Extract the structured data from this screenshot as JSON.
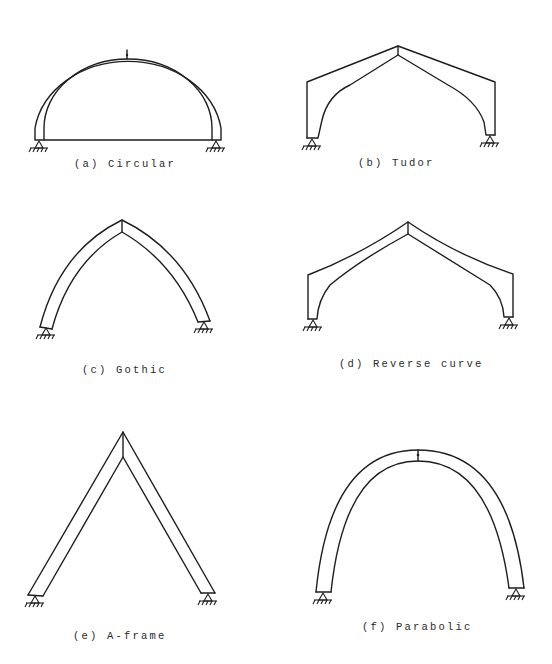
{
  "figure": {
    "panels": [
      {
        "id": "a",
        "label": "(a) Circular",
        "shape": "circular"
      },
      {
        "id": "b",
        "label": "(b) Tudor",
        "shape": "tudor"
      },
      {
        "id": "c",
        "label": "(c) Gothic",
        "shape": "gothic"
      },
      {
        "id": "d",
        "label": "(d) Reverse curve",
        "shape": "reverse-curve"
      },
      {
        "id": "e",
        "label": "(e) A-frame",
        "shape": "a-frame"
      },
      {
        "id": "f",
        "label": "(f) Parabolic",
        "shape": "parabolic"
      }
    ],
    "colors": {
      "line": "#1e1e1e",
      "background": "#ffffff",
      "text": "#2a2a2a"
    }
  }
}
